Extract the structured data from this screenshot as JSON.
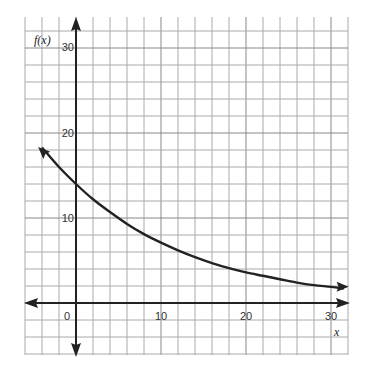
{
  "chart_data": {
    "type": "line",
    "title": "",
    "xlabel": "x",
    "ylabel": "f(x)",
    "xlim": [
      -6,
      32
    ],
    "ylim": [
      -6,
      33.5
    ],
    "grid": true,
    "grid_step": 2,
    "x_ticks": [
      0,
      10,
      20,
      30
    ],
    "y_ticks": [
      10,
      20,
      30
    ],
    "x_tick_labels": [
      "0",
      "10",
      "20",
      "30"
    ],
    "y_tick_labels": [
      "10",
      "20",
      "30"
    ],
    "legend": null,
    "series": [
      {
        "name": "f(x)",
        "description": "Exponential decay curve with arrowheads at both ends",
        "x": [
          -4,
          -2,
          0,
          2,
          4,
          6,
          8,
          10,
          12,
          14,
          16,
          18,
          20,
          22,
          24,
          26,
          28,
          30,
          31.5
        ],
        "y": [
          18.3,
          16.0,
          14.0,
          12.2,
          10.7,
          9.3,
          8.1,
          7.1,
          6.2,
          5.4,
          4.7,
          4.1,
          3.6,
          3.2,
          2.8,
          2.4,
          2.1,
          1.9,
          1.7
        ],
        "color": "#222222"
      }
    ],
    "y_intercept": 14,
    "end_arrows": {
      "left": [
        -4.1,
        18
      ],
      "right": [
        31.6,
        1.9
      ]
    }
  },
  "labels": {
    "y_axis": "f(x)",
    "x_axis": "x",
    "origin": "0",
    "x10": "10",
    "x20": "20",
    "x30": "30",
    "y10": "10",
    "y20": "20",
    "y30": "30"
  }
}
